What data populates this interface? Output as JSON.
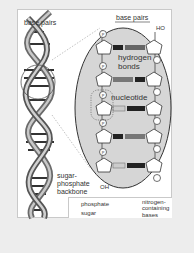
{
  "diagram": {
    "labels": {
      "base_pairs_left": "base pairs",
      "base_pairs_right": "base pairs",
      "ho": "HO",
      "hydrogen_bonds_1": "hydrogen",
      "hydrogen_bonds_2": "bonds",
      "nucleotide": "nucleotide",
      "oh": "OH",
      "backbone_1": "sugar-",
      "backbone_2": "phosphate",
      "backbone_3": "backbone"
    },
    "legend": {
      "phosphate": "phosphate",
      "sugar": "sugar",
      "bases_1": "nitrogen-",
      "bases_2": "containing",
      "bases_3": "bases",
      "phosphate_symbol": "P"
    },
    "colors": {
      "background": "#ededed",
      "panel": "#ffffff",
      "magnified_circle": "#d4d4d4",
      "helix_dark": "#555555",
      "helix_light": "#bdbdbd"
    }
  }
}
